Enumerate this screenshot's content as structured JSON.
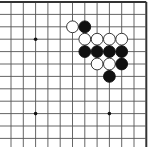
{
  "diagram": {
    "type": "go-board-fragment",
    "visible_corner": "top-right",
    "grid": {
      "columns": 12,
      "rows": 12,
      "origin_x": 11,
      "origin_y": 2,
      "spacing_x": 12.3,
      "spacing_y": 12.4,
      "thick_edges": [
        "top",
        "right"
      ],
      "line_color": "#555555",
      "edge_color": "#333333"
    },
    "star_points": [
      {
        "col": 2,
        "row": 3
      },
      {
        "col": 2,
        "row": 9
      },
      {
        "col": 8,
        "row": 9
      }
    ],
    "stones": [
      {
        "color": "white",
        "col": 5,
        "row": 2
      },
      {
        "color": "black",
        "col": 6,
        "row": 2
      },
      {
        "color": "white",
        "col": 6,
        "row": 3
      },
      {
        "color": "white",
        "col": 7,
        "row": 3
      },
      {
        "color": "white",
        "col": 8,
        "row": 3
      },
      {
        "color": "white",
        "col": 9,
        "row": 3
      },
      {
        "color": "black",
        "col": 6,
        "row": 4
      },
      {
        "color": "black",
        "col": 7,
        "row": 4
      },
      {
        "color": "black",
        "col": 8,
        "row": 4
      },
      {
        "color": "black",
        "col": 9,
        "row": 4
      },
      {
        "color": "white",
        "col": 7,
        "row": 5
      },
      {
        "color": "white",
        "col": 8,
        "row": 5
      },
      {
        "color": "black",
        "col": 9,
        "row": 5
      },
      {
        "color": "black",
        "col": 8,
        "row": 6
      }
    ],
    "colors": {
      "background": "#ffffff",
      "black_stone": "#111111",
      "white_stone_fill": "#ffffff",
      "white_stone_stroke": "#222222"
    }
  }
}
